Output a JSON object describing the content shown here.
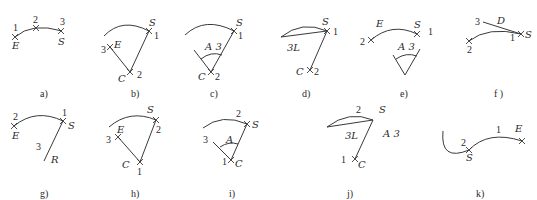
{
  "figure": {
    "panels": [
      {
        "id": "a",
        "caption": "a)",
        "labels": {
          "p1": "1",
          "p2": "2",
          "p3": "3",
          "start": "S",
          "end": "E"
        }
      },
      {
        "id": "b",
        "caption": "b)",
        "labels": {
          "p1": "1",
          "p2": "2",
          "p3": "3",
          "start": "S",
          "center": "C",
          "end": "E"
        }
      },
      {
        "id": "c",
        "caption": "c)",
        "labels": {
          "p1": "1",
          "p2": "2",
          "start": "S",
          "center": "C",
          "angle": "A 3"
        }
      },
      {
        "id": "d",
        "caption": "d)",
        "labels": {
          "p1": "1",
          "p2": "2",
          "start": "S",
          "center": "C",
          "length": "3L"
        }
      },
      {
        "id": "e",
        "caption": "e)",
        "labels": {
          "p1": "1",
          "p2": "2",
          "start": "S",
          "end": "E",
          "angle": "A 3"
        }
      },
      {
        "id": "f",
        "caption": "f )",
        "labels": {
          "p1": "1",
          "p2": "2",
          "p3": "3",
          "start": "S",
          "direction": "D"
        }
      },
      {
        "id": "g",
        "caption": "g)",
        "labels": {
          "p1": "1",
          "p2": "2",
          "p3": "3",
          "start": "S",
          "end": "E",
          "radius": "R"
        }
      },
      {
        "id": "h",
        "caption": "h)",
        "labels": {
          "p1": "1",
          "p2": "2",
          "p3": "3",
          "start": "S",
          "center": "C",
          "end": "E"
        }
      },
      {
        "id": "i",
        "caption": "i)",
        "labels": {
          "p1": "1",
          "p2": "2",
          "p3": "3",
          "start": "S",
          "center": "C",
          "angle": "A"
        }
      },
      {
        "id": "j",
        "caption": "j)",
        "labels": {
          "p1": "1",
          "p2": "2",
          "start": "S",
          "center": "C",
          "length": "3L",
          "angle": "A 3"
        }
      },
      {
        "id": "k",
        "caption": "k)",
        "labels": {
          "p1": "1",
          "p2": "2",
          "start": "S",
          "end": "E"
        }
      }
    ]
  }
}
